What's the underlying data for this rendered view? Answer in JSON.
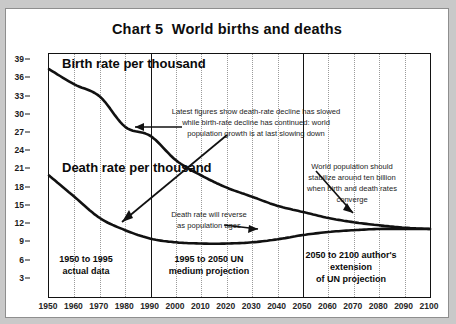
{
  "title": "Chart 5  World births and deaths",
  "series_labels": {
    "birth": "Birth rate per thousand",
    "death": "Death rate per thousand"
  },
  "annotations": {
    "center": "Latest figures show death-rate decline has slowed\nwhile birth-rate decline has continued: world\npopulation growth is at last slowing down",
    "right": "World population should\nstabilize around ten billion\nwhen birth and death rates\nconverge",
    "death_reverse": "Death rate will reverse\nas population ages"
  },
  "period_boxes": [
    {
      "text": "1950 to 1995\nactual data"
    },
    {
      "text": "1995 to 2050 UN\nmedium projection"
    },
    {
      "text": "2050 to 2100 author's\nextension\nof UN projection"
    }
  ],
  "colors": {
    "line": "#111111",
    "grid": "#9a9a9a",
    "paper": "#ffffff",
    "frame": "#121212",
    "backdrop": "#c9c9c9"
  },
  "chart_data": {
    "type": "line",
    "title": "Chart 5  World births and deaths",
    "xlabel": "",
    "ylabel": "Rate per thousand",
    "xlim": [
      1950,
      2100
    ],
    "ylim": [
      0,
      40
    ],
    "ytick_labels": [
      "39",
      "36",
      "33",
      "30",
      "27",
      "24",
      "21",
      "18",
      "15",
      "12",
      "9",
      "6",
      "3"
    ],
    "ytick_values": [
      39,
      36,
      33,
      30,
      27,
      24,
      21,
      18,
      15,
      12,
      9,
      6,
      3
    ],
    "xtick_labels": [
      "1950",
      "1960",
      "1970",
      "1980",
      "1990",
      "2000",
      "2010",
      "2020",
      "2030",
      "2040",
      "2050",
      "2060",
      "2070",
      "2080",
      "2090",
      "2100"
    ],
    "x": [
      1950,
      1960,
      1970,
      1980,
      1990,
      2000,
      2010,
      2020,
      2030,
      2040,
      2050,
      2060,
      2070,
      2080,
      2090,
      2100
    ],
    "grid": "dotted vertical decade gridlines",
    "legend": "inline labels on curves",
    "dividers": [
      1990,
      2050
    ],
    "series": [
      {
        "name": "Birth rate per thousand",
        "values": [
          37.5,
          35.0,
          33.0,
          28.0,
          26.5,
          22.5,
          20.0,
          18.0,
          16.5,
          15.0,
          14.0,
          13.0,
          12.3,
          11.8,
          11.4,
          11.2
        ]
      },
      {
        "name": "Death rate per thousand",
        "values": [
          20.0,
          16.5,
          13.0,
          11.0,
          9.6,
          9.0,
          8.8,
          8.8,
          9.0,
          9.5,
          10.2,
          10.7,
          11.0,
          11.2,
          11.2,
          11.2
        ]
      }
    ]
  }
}
